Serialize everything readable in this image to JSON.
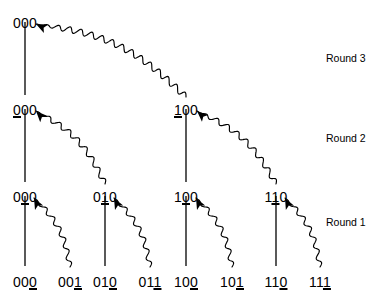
{
  "figure": {
    "background_color": "#ffffff",
    "line_color": "#000000",
    "text_color": "#000000",
    "width": 369,
    "height": 294
  },
  "round_labels": [
    {
      "name": "round-3-label",
      "text": "Round 3",
      "x": 326,
      "y": 53
    },
    {
      "name": "round-2-label",
      "text": "Round 2",
      "x": 326,
      "y": 133
    },
    {
      "name": "round-1-label",
      "text": "Round 1",
      "x": 326,
      "y": 217
    }
  ],
  "rows": [
    {
      "name": "champion-row",
      "row_index": 0,
      "y": 16,
      "nodes": [
        {
          "text": "000",
          "prefix": "",
          "underlined": "",
          "suffix": "000",
          "x": 25
        }
      ]
    },
    {
      "name": "round-2-winners-row",
      "row_index": 1,
      "y": 103,
      "nodes": [
        {
          "text": "000",
          "prefix": "",
          "underlined": "0",
          "suffix": "00",
          "x": 25
        },
        {
          "text": "100",
          "prefix": "",
          "underlined": "1",
          "suffix": "00",
          "x": 186
        }
      ]
    },
    {
      "name": "round-1-winners-row",
      "row_index": 2,
      "y": 190,
      "nodes": [
        {
          "text": "000",
          "prefix": "0",
          "underlined": "0",
          "suffix": "0",
          "x": 25
        },
        {
          "text": "010",
          "prefix": "0",
          "underlined": "1",
          "suffix": "0",
          "x": 105
        },
        {
          "text": "100",
          "prefix": "1",
          "underlined": "0",
          "suffix": "0",
          "x": 186
        },
        {
          "text": "110",
          "prefix": "1",
          "underlined": "1",
          "suffix": "0",
          "x": 276
        }
      ]
    },
    {
      "name": "participants-row",
      "row_index": 3,
      "y": 275,
      "nodes": [
        {
          "text": "000",
          "prefix": "00",
          "underlined": "0",
          "suffix": "",
          "x": 25
        },
        {
          "text": "001",
          "prefix": "00",
          "underlined": "1",
          "suffix": "",
          "x": 70
        },
        {
          "text": "010",
          "prefix": "01",
          "underlined": "0",
          "suffix": "",
          "x": 105
        },
        {
          "text": "011",
          "prefix": "01",
          "underlined": "1",
          "suffix": "",
          "x": 150
        },
        {
          "text": "100",
          "prefix": "10",
          "underlined": "0",
          "suffix": "",
          "x": 186
        },
        {
          "text": "101",
          "prefix": "10",
          "underlined": "1",
          "suffix": "",
          "x": 232
        },
        {
          "text": "110",
          "prefix": "11",
          "underlined": "0",
          "suffix": "",
          "x": 276
        },
        {
          "text": "111",
          "prefix": "11",
          "underlined": "1",
          "suffix": "",
          "x": 320
        }
      ]
    }
  ],
  "stems": [
    {
      "name": "stem-champion",
      "x": 25,
      "y1": 22,
      "y2": 95
    },
    {
      "name": "stem-r2-left",
      "x": 25,
      "y1": 109,
      "y2": 182
    },
    {
      "name": "stem-r2-right",
      "x": 186,
      "y1": 109,
      "y2": 182
    },
    {
      "name": "stem-r1-a",
      "x": 25,
      "y1": 196,
      "y2": 266
    },
    {
      "name": "stem-r1-b",
      "x": 105,
      "y1": 196,
      "y2": 266
    },
    {
      "name": "stem-r1-c",
      "x": 186,
      "y1": 196,
      "y2": 266
    },
    {
      "name": "stem-r1-d",
      "x": 276,
      "y1": 196,
      "y2": 266
    }
  ],
  "wavy_arrows": [
    {
      "name": "wavy-arrow-round3",
      "from_x": 186,
      "from_y": 97,
      "to_x": 36,
      "to_y": 24,
      "amplitude": 3.0,
      "wavelength": 11,
      "round": "Round 3"
    },
    {
      "name": "wavy-arrow-round2-left",
      "from_x": 105,
      "from_y": 184,
      "to_x": 36,
      "to_y": 111,
      "amplitude": 2.6,
      "wavelength": 12,
      "round": "Round 2"
    },
    {
      "name": "wavy-arrow-round2-right",
      "from_x": 276,
      "from_y": 184,
      "to_x": 197,
      "to_y": 111,
      "amplitude": 2.6,
      "wavelength": 12,
      "round": "Round 2"
    },
    {
      "name": "wavy-arrow-round1-a",
      "from_x": 70,
      "from_y": 267,
      "to_x": 34,
      "to_y": 198,
      "amplitude": 2.4,
      "wavelength": 12,
      "round": "Round 1"
    },
    {
      "name": "wavy-arrow-round1-b",
      "from_x": 150,
      "from_y": 267,
      "to_x": 114,
      "to_y": 198,
      "amplitude": 2.4,
      "wavelength": 12,
      "round": "Round 1"
    },
    {
      "name": "wavy-arrow-round1-c",
      "from_x": 232,
      "from_y": 267,
      "to_x": 196,
      "to_y": 198,
      "amplitude": 2.4,
      "wavelength": 12,
      "round": "Round 1"
    },
    {
      "name": "wavy-arrow-round1-d",
      "from_x": 320,
      "from_y": 267,
      "to_x": 285,
      "to_y": 198,
      "amplitude": 2.4,
      "wavelength": 12,
      "round": "Round 1"
    }
  ]
}
